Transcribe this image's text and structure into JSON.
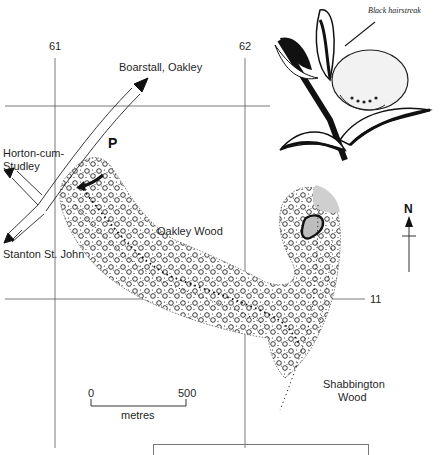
{
  "map": {
    "grid": {
      "eastings": [
        "61",
        "62"
      ],
      "northings": [
        "11"
      ]
    },
    "roads": {
      "destinations": [
        "Boarstall, Oakley",
        "Horton-cum-Studley",
        "Stanton St. John"
      ],
      "boarstall": "Boarstall, Oakley",
      "horton_line1": "Horton-cum-",
      "horton_line2": "Studley",
      "stanton": "Stanton St. John"
    },
    "parking": "P",
    "woods": {
      "oakley": "Oakley Wood",
      "shabbington_line1": "Shabbington",
      "shabbington_line2": "Wood"
    },
    "north_arrow": "N",
    "scale_bar": {
      "start": "0",
      "end": "500",
      "unit": "metres"
    },
    "illustration": {
      "caption": "Black hairstreak",
      "icon": "butterfly-on-twig-illustration"
    },
    "colors": {
      "ink": "#1a1a1a",
      "grid_line": "#555555",
      "highlight_area": "#cfcfcf",
      "background": "#ffffff"
    }
  }
}
